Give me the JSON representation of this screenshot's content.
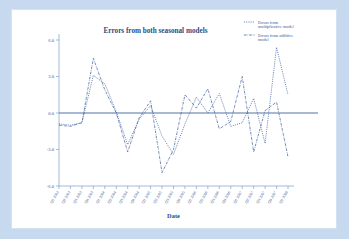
{
  "window": {
    "background_color": "#c7d9ef",
    "card_color": "#ffffff"
  },
  "chart_data": {
    "type": "line",
    "title": "Errors from both seasonal models",
    "xlabel": "Date",
    "ylabel": "",
    "ylim": [
      -6.0,
      6.0
    ],
    "yticks": [
      "6.0",
      "3.0",
      "0.0",
      "-3.0",
      "-6.0"
    ],
    "ytick_values": [
      6.0,
      3.0,
      0.0,
      -3.0,
      -6.0
    ],
    "grid": false,
    "legend_position": "top-right",
    "accent_color": "#3f63a0",
    "title_color": "#2e4c86",
    "axis_color": "#7f9fc9",
    "reference_line": 0.0,
    "categories": [
      "Q1 2003",
      "Q2 2003",
      "Q3 2003",
      "Q4 2003",
      "Q1 2004",
      "Q2 2004",
      "Q3 2004",
      "Q4 2004",
      "Q1 2005",
      "Q2 2005",
      "Q3 2005",
      "Q4 2005",
      "Q1 2006",
      "Q2 2006",
      "Q3 2006",
      "Q4 2006",
      "Q1 2007",
      "Q2 2007",
      "Q3 2007",
      "Q4 2007",
      "Q1 2008"
    ],
    "series": [
      {
        "name": "Errors from multiplicative model",
        "style": "dotted",
        "values": [
          -0.9,
          -1.0,
          -0.8,
          3.1,
          2.4,
          0.1,
          -2.6,
          -0.5,
          0.6,
          -1.9,
          -3.4,
          -0.9,
          1.3,
          0.0,
          1.6,
          -1.1,
          -0.8,
          1.2,
          -2.5,
          5.4,
          1.5
        ]
      },
      {
        "name": "Errors from additive model",
        "style": "dash-dot",
        "values": [
          -1.0,
          -1.1,
          -0.8,
          4.5,
          1.9,
          0.0,
          -3.2,
          -0.4,
          1.0,
          -4.9,
          -3.0,
          1.5,
          0.4,
          2.0,
          -1.3,
          -0.7,
          3.0,
          -3.2,
          0.2,
          0.9,
          -3.6
        ]
      }
    ],
    "legend": [
      {
        "label_line1": "Errors from",
        "label_line2": "multiplicative model",
        "style": "dotted"
      },
      {
        "label_line1": "Errors from additive",
        "label_line2": "model",
        "style": "dash-dot"
      }
    ]
  }
}
